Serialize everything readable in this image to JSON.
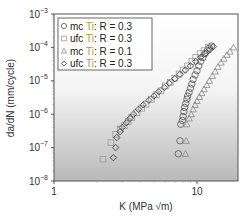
{
  "chart_data": {
    "type": "scatter",
    "title": "",
    "xlabel": "K (MPa √m)",
    "ylabel": "da/dN (mm/cycle)",
    "xscale": "log",
    "yscale": "log",
    "xlim": [
      1,
      20
    ],
    "ylim": [
      1e-08,
      0.001
    ],
    "x_ticks": [
      {
        "value": 1,
        "label": "1"
      },
      {
        "value": 10,
        "label": "10"
      }
    ],
    "y_ticks": [
      {
        "value": 0.001,
        "label": "10",
        "exp": "−3"
      },
      {
        "value": 0.0001,
        "label": "10",
        "exp": "−4"
      },
      {
        "value": 1e-05,
        "label": "10",
        "exp": "−5"
      },
      {
        "value": 1e-06,
        "label": "10",
        "exp": "−6"
      },
      {
        "value": 1e-07,
        "label": "10",
        "exp": "−7"
      },
      {
        "value": 1e-08,
        "label": "10",
        "exp": "−8"
      }
    ],
    "grid": false,
    "legend_position": "upper left",
    "background": "vertical gradient white to gray",
    "series": [
      {
        "name": "mc Ti: R = 0.3",
        "marker": "circle",
        "points": [
          [
            7.4,
            6.5e-08
          ],
          [
            7.6,
            1.6e-07
          ],
          [
            7.7,
            5e-07
          ],
          [
            7.9,
            6.5e-07
          ],
          [
            8.0,
            8.5e-07
          ],
          [
            8.1,
            1.2e-06
          ],
          [
            8.2,
            1.6e-06
          ],
          [
            8.35,
            2.1e-06
          ],
          [
            8.5,
            2.8e-06
          ],
          [
            8.6,
            3.5e-06
          ],
          [
            8.8,
            4.5e-06
          ],
          [
            9.0,
            6e-06
          ],
          [
            9.2,
            8e-06
          ],
          [
            9.4,
            1.1e-05
          ],
          [
            9.7,
            1.5e-05
          ],
          [
            10.0,
            2e-05
          ],
          [
            10.3,
            2.8e-05
          ],
          [
            10.6,
            3.8e-05
          ],
          [
            11.0,
            5e-05
          ],
          [
            11.4,
            6.5e-05
          ],
          [
            11.8,
            8e-05
          ],
          [
            12.2,
            9.5e-05
          ],
          [
            12.6,
            0.00011
          ]
        ]
      },
      {
        "name": "ufc Ti: R = 0.3",
        "marker": "square",
        "points": [
          [
            2.2,
            4.5e-08
          ],
          [
            2.5,
            1.4e-07
          ],
          [
            2.7,
            2.5e-07
          ],
          [
            2.9,
            3.6e-07
          ],
          [
            3.1,
            4.5e-07
          ],
          [
            3.3,
            6e-07
          ],
          [
            3.5,
            8e-07
          ],
          [
            3.8,
            1.1e-06
          ],
          [
            4.1,
            1.5e-06
          ],
          [
            4.4,
            2e-06
          ],
          [
            4.8,
            2.8e-06
          ],
          [
            5.2,
            3.8e-06
          ],
          [
            5.6,
            5e-06
          ],
          [
            6.0,
            7e-06
          ],
          [
            6.5,
            9e-06
          ],
          [
            7.0,
            1.2e-05
          ],
          [
            7.5,
            1.6e-05
          ],
          [
            8.0,
            2.1e-05
          ],
          [
            8.6,
            2.8e-05
          ],
          [
            9.2,
            3.8e-05
          ],
          [
            9.8,
            5e-05
          ],
          [
            10.5,
            6.5e-05
          ],
          [
            11.2,
            8e-05
          ],
          [
            12.0,
            0.0001
          ]
        ]
      },
      {
        "name": "mc Ti: R = 0.1",
        "marker": "triangle",
        "points": [
          [
            8.3,
            6.5e-08
          ],
          [
            8.4,
            1.6e-07
          ],
          [
            8.5,
            5e-07
          ],
          [
            8.8,
            7.5e-07
          ],
          [
            9.1,
            1e-06
          ],
          [
            9.4,
            1.4e-06
          ],
          [
            9.7,
            1.9e-06
          ],
          [
            10.0,
            2.5e-06
          ],
          [
            10.4,
            3.3e-06
          ],
          [
            10.8,
            4.3e-06
          ],
          [
            11.2,
            5.6e-06
          ],
          [
            11.7,
            7.5e-06
          ],
          [
            12.2,
            1e-05
          ],
          [
            12.8,
            1.4e-05
          ],
          [
            13.4,
            1.9e-05
          ],
          [
            14.0,
            2.6e-05
          ],
          [
            14.7,
            3.5e-05
          ],
          [
            15.4,
            4.6e-05
          ],
          [
            16.2,
            6e-05
          ],
          [
            17.0,
            7.5e-05
          ],
          [
            18.0,
            0.0001
          ]
        ]
      },
      {
        "name": "ufc Ti: R = 0.3",
        "marker": "diamond",
        "points": [
          [
            2.6,
            5e-08
          ],
          [
            2.7,
            1e-07
          ],
          [
            2.75,
            2e-07
          ],
          [
            2.9,
            3e-07
          ],
          [
            3.0,
            4e-07
          ],
          [
            3.2,
            5.5e-07
          ],
          [
            3.4,
            7.5e-07
          ],
          [
            3.6,
            1e-06
          ],
          [
            3.9,
            1.4e-06
          ],
          [
            4.2,
            1.9e-06
          ],
          [
            4.6,
            2.6e-06
          ],
          [
            5.0,
            3.5e-06
          ],
          [
            5.4,
            4.7e-06
          ],
          [
            5.9,
            6.3e-06
          ],
          [
            6.4,
            8.5e-06
          ],
          [
            7.0,
            1.15e-05
          ],
          [
            7.6,
            1.55e-05
          ],
          [
            8.3,
            2.1e-05
          ],
          [
            9.0,
            2.8e-05
          ],
          [
            9.8,
            3.8e-05
          ],
          [
            10.6,
            5e-05
          ],
          [
            11.4,
            6.5e-05
          ],
          [
            12.3,
            8.5e-05
          ],
          [
            13.0,
            0.000105
          ]
        ]
      }
    ],
    "legend": [
      {
        "marker": "circle",
        "prefix": "mc ",
        "material": "Ti",
        "suffix": ": R = 0.3"
      },
      {
        "marker": "square",
        "prefix": "ufc ",
        "material": "Ti",
        "suffix": ": R = 0.3"
      },
      {
        "marker": "triangle",
        "prefix": "mc ",
        "material": "Ti",
        "suffix": ": R = 0.1"
      },
      {
        "marker": "diamond",
        "prefix": "ufc ",
        "material": "Ti",
        "suffix": ": R = 0.3"
      }
    ],
    "colors": {
      "marker_stroke": "#555555",
      "square_stroke": "#9a9a9a",
      "triangle_stroke": "#8a8a8a",
      "ti_highlight": "#d9c24a",
      "axis": "#444444",
      "bg_top": "#ffffff",
      "bg_bottom": "#b8b8b8"
    }
  }
}
